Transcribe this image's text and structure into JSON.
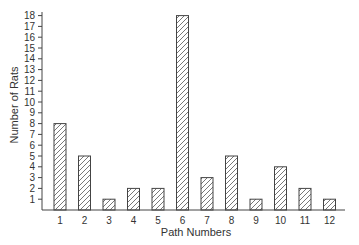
{
  "chart_data": {
    "type": "bar",
    "title": "",
    "xlabel": "Path Numbers",
    "ylabel": "Number of Rats",
    "categories": [
      "1",
      "2",
      "3",
      "4",
      "5",
      "6",
      "7",
      "8",
      "9",
      "10",
      "11",
      "12"
    ],
    "values": [
      8,
      5,
      1,
      2,
      2,
      18,
      3,
      5,
      1,
      4,
      2,
      1
    ],
    "ylim": [
      0,
      18
    ],
    "yticks": [
      1,
      2,
      3,
      4,
      5,
      6,
      7,
      8,
      9,
      10,
      11,
      12,
      13,
      14,
      15,
      16,
      17,
      18
    ],
    "grid": false,
    "legend": null,
    "bar_fill": "hatched",
    "colors": {
      "bar_stroke": "#444444",
      "hatch": "#555555",
      "axis": "#444444"
    }
  }
}
